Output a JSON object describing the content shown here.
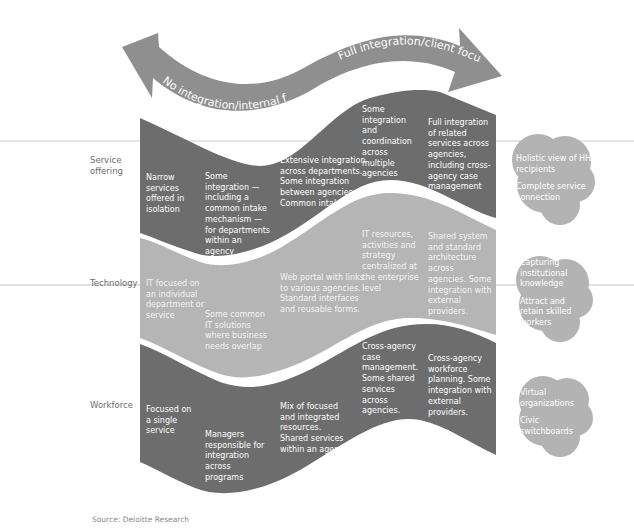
{
  "arrow": {
    "left_label": "No integration/internal focus",
    "right_label": "Full integration/client focus",
    "color": "#8f8f8f"
  },
  "colors": {
    "dark_band": "#6d6d6d",
    "light_band": "#b5b5b5",
    "cloud": "#b3b3b3",
    "rule_line": "#d9d9d9"
  },
  "rows": [
    {
      "label": "Service offering",
      "stages": [
        "Narrow services offered in isolation",
        "Some integration — including a common intake mechanism — for departments within an agency",
        "Extensive integration across departments. Some integration between agencies. Common intake.",
        "Some integration and coordination across multiple agencies",
        "Full integration of related services across agencies, including cross-agency case management"
      ],
      "outcomes": [
        "Holistic view of HHS recipients",
        "Complete service connection"
      ]
    },
    {
      "label": "Technology",
      "stages": [
        "IT focused on an individual department or service",
        "Some common IT solutions where business needs overlap",
        "Web portal with links to various agencies. Standard interfaces and reusable forms.",
        "IT resources, activities and strategy centralized at the enterprise level",
        "Shared system and standard architecture across agencies. Some integration with external providers."
      ],
      "outcomes": [
        "Capturing institutional knowledge",
        "Attract and retain skilled workers"
      ]
    },
    {
      "label": "Workforce",
      "stages": [
        "Focused on a single service",
        "Managers responsible for integration across programs",
        "Mix of focused and integrated resources. Shared services within an agency",
        "Cross-agency case management. Some shared services across agencies.",
        "Cross-agency workforce planning. Some integration with external providers."
      ],
      "outcomes": [
        "Virtual organizations",
        "Civic switchboards"
      ]
    }
  ],
  "source": "Source: Deloitte Research"
}
